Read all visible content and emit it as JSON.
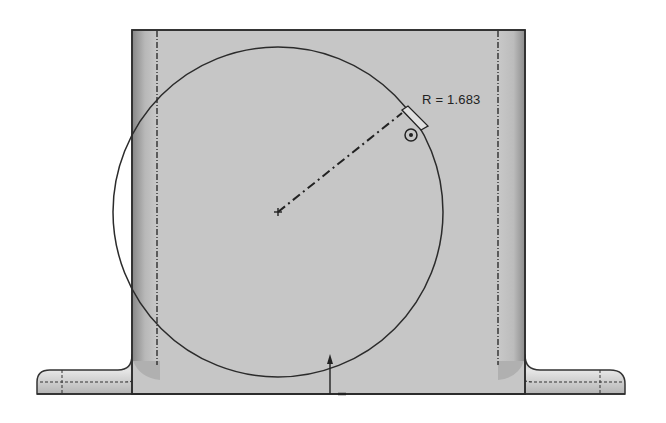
{
  "drawing": {
    "type": "CAD sketch view",
    "part": "bracket with base flanges",
    "colors": {
      "face": "#c4c4c4",
      "face_light": "#d2d2d2",
      "edge": "#333333",
      "background": "#ffffff"
    },
    "sketch_circle": {
      "center": [
        278,
        212
      ],
      "radius": 165
    },
    "dimension": {
      "label": "R = 1.683",
      "kind": "radius"
    },
    "icons": {
      "center_point": "plus-marker-icon",
      "dimension_handle": "dimension-handle-icon",
      "anchor": "target-anchor-icon",
      "pointer": "arrow-pointer-icon"
    }
  }
}
